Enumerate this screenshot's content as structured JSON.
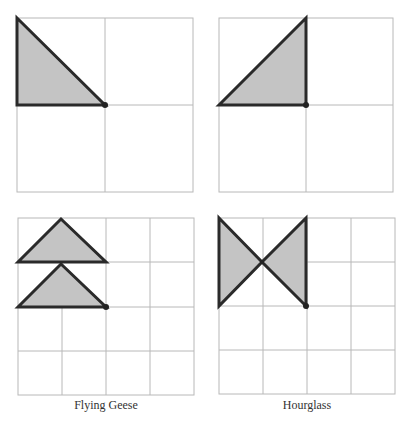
{
  "captions": {
    "flying_geese": "Flying Geese",
    "hourglass": "Hourglass"
  },
  "colors": {
    "fill": "#c4c4c4",
    "outline": "#2a2a2a",
    "grid": "#b8b8b8"
  },
  "panels": [
    {
      "id": "top-left",
      "grid": "2x2",
      "shape": "right triangle, upper-left quadrant, hypotenuse from top-left to center"
    },
    {
      "id": "top-right",
      "grid": "2x2",
      "shape": "right triangle, upper-left quadrant, hypotenuse from bottom-left to top-center"
    },
    {
      "id": "bottom-left",
      "grid": "4x4",
      "shape": "two stacked isosceles triangles (flying geese)"
    },
    {
      "id": "bottom-right",
      "grid": "4x4",
      "shape": "two triangles meeting at a point (hourglass)"
    }
  ]
}
